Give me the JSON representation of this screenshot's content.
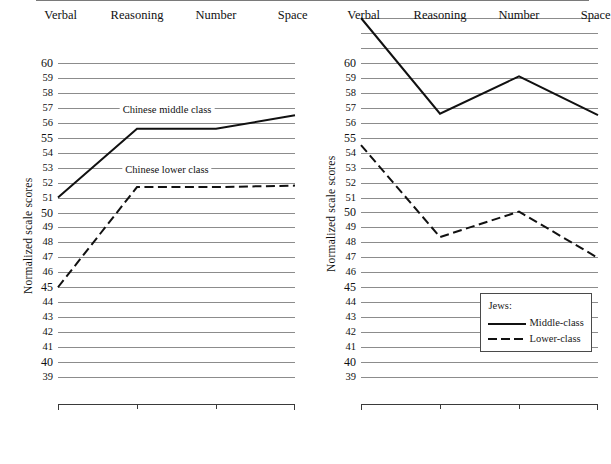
{
  "figure": {
    "background": "#ffffff",
    "line_color": "#111111",
    "grid_color": "#8c8c8c",
    "axis_color": "#3a3a3a"
  },
  "axis": {
    "ylabel": "Normalized scale scores",
    "categories": [
      "Verbal",
      "Reasoning",
      "Number",
      "Space"
    ],
    "ytick_labels_left": [
      "60",
      "59",
      "58",
      "57",
      "56",
      "55",
      "54",
      "53",
      "52",
      "51",
      "50",
      "49",
      "48",
      "47",
      "46",
      "45",
      "44",
      "43",
      "42",
      "41",
      "40",
      "39"
    ],
    "ytick_labels_right": [
      "60",
      "59",
      "58",
      "57",
      "56",
      "55",
      "54",
      "53",
      "52",
      "51",
      "50",
      "49",
      "48",
      "47",
      "46",
      "45",
      "44",
      "43",
      "42",
      "41",
      "40",
      "39"
    ],
    "major_ticks": [
      "60",
      "55",
      "50",
      "45",
      "40"
    ]
  },
  "legend": {
    "title": "Jews:",
    "entries": [
      {
        "label": "Middle-class",
        "style": "solid"
      },
      {
        "label": "Lower-class",
        "style": "dashed"
      }
    ]
  },
  "annotations": {
    "chinese_middle": "Chinese middle class",
    "chinese_lower": "Chinese lower class"
  },
  "chart_data": [
    {
      "type": "line",
      "title": "",
      "panel": "left",
      "xlabel": "",
      "ylabel": "Normalized scale scores",
      "categories": [
        "Verbal",
        "Reasoning",
        "Number",
        "Space"
      ],
      "ylim": [
        39,
        60
      ],
      "ygrid_step": 1,
      "grid": true,
      "legend": "inline annotations",
      "series": [
        {
          "name": "Chinese middle class",
          "style": "solid",
          "values": [
            51.0,
            55.6,
            55.6,
            56.5
          ]
        },
        {
          "name": "Chinese lower class",
          "style": "dashed",
          "values": [
            45.0,
            51.7,
            51.7,
            51.8
          ]
        }
      ]
    },
    {
      "type": "line",
      "title": "",
      "panel": "right",
      "xlabel": "",
      "ylabel": "Normalized scale scores",
      "categories": [
        "Verbal",
        "Reasoning",
        "Number",
        "Space"
      ],
      "ylim": [
        39,
        63
      ],
      "ygrid_step": 1,
      "grid": true,
      "legend": "box: Jews:",
      "series": [
        {
          "name": "Middle-class",
          "style": "solid",
          "values": [
            63.0,
            56.6,
            59.1,
            56.5
          ]
        },
        {
          "name": "Lower-class",
          "style": "dashed",
          "values": [
            54.5,
            48.35,
            50.05,
            46.95
          ]
        }
      ]
    }
  ]
}
